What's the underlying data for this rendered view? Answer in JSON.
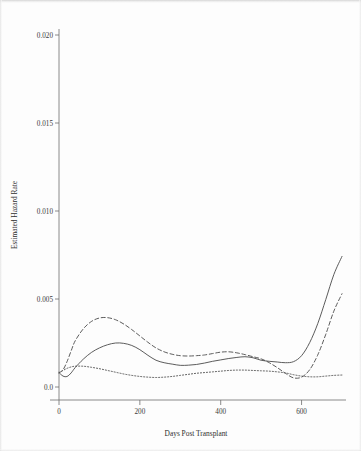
{
  "chart_data": {
    "type": "line",
    "title": "",
    "xlabel": "Days Post Transplant",
    "ylabel": "Estimated Hazard Rate",
    "xlim": [
      0,
      700
    ],
    "ylim": [
      0.0,
      0.0205
    ],
    "grid": false,
    "legend_position": "none",
    "xticks": [
      0,
      200,
      400,
      600
    ],
    "xtick_labels": [
      "0",
      "200",
      "400",
      "600"
    ],
    "yticks": [
      0.0,
      0.005,
      0.01,
      0.015,
      0.02
    ],
    "ytick_labels": [
      "0.0",
      "0.005",
      "0.010",
      "0.015",
      "0.020"
    ],
    "x": [
      0,
      10,
      20,
      30,
      40,
      60,
      80,
      100,
      120,
      140,
      160,
      180,
      200,
      220,
      240,
      260,
      280,
      300,
      320,
      340,
      360,
      380,
      400,
      420,
      440,
      460,
      480,
      500,
      520,
      540,
      560,
      580,
      600,
      620,
      640,
      660,
      680,
      700
    ],
    "series": [
      {
        "name": "solid",
        "style": "solid",
        "values": [
          0.00082,
          0.00062,
          0.0006,
          0.0008,
          0.0011,
          0.00158,
          0.00196,
          0.00222,
          0.0024,
          0.0025,
          0.00248,
          0.00236,
          0.00212,
          0.0018,
          0.00152,
          0.00138,
          0.0013,
          0.00123,
          0.00124,
          0.00128,
          0.00136,
          0.00146,
          0.00154,
          0.00162,
          0.00168,
          0.00172,
          0.00166,
          0.00152,
          0.00146,
          0.00142,
          0.00138,
          0.00144,
          0.00178,
          0.00252,
          0.0036,
          0.00498,
          0.0064,
          0.00742
        ]
      },
      {
        "name": "dashed",
        "style": "dashed",
        "values": [
          0.0008,
          0.00098,
          0.00145,
          0.00205,
          0.00262,
          0.0033,
          0.00372,
          0.00392,
          0.00394,
          0.00382,
          0.00358,
          0.00326,
          0.0029,
          0.00254,
          0.00222,
          0.002,
          0.00186,
          0.00178,
          0.00176,
          0.00178,
          0.00182,
          0.0019,
          0.00198,
          0.002,
          0.00194,
          0.00184,
          0.00172,
          0.0016,
          0.00138,
          0.0011,
          0.00078,
          0.00052,
          0.00056,
          0.00098,
          0.00182,
          0.003,
          0.00432,
          0.0053
        ]
      },
      {
        "name": "dotted",
        "style": "dotted",
        "values": [
          0.00082,
          0.00094,
          0.00106,
          0.00114,
          0.00118,
          0.00118,
          0.00112,
          0.00104,
          0.00094,
          0.00084,
          0.00074,
          0.00066,
          0.0006,
          0.00056,
          0.00054,
          0.00056,
          0.0006,
          0.00066,
          0.00072,
          0.00078,
          0.00082,
          0.00086,
          0.0009,
          0.00094,
          0.00096,
          0.00096,
          0.00094,
          0.00092,
          0.0009,
          0.00086,
          0.0008,
          0.0007,
          0.00062,
          0.00058,
          0.00058,
          0.00062,
          0.00066,
          0.00068
        ]
      }
    ]
  },
  "axes": {
    "x_title": "Days Post Transplant",
    "y_title": "Estimated Hazard Rate"
  }
}
